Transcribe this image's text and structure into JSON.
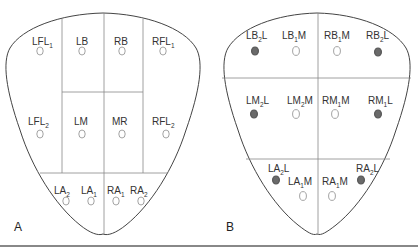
{
  "figure": {
    "panels": [
      {
        "letter": "A",
        "regions": [
          {
            "label": "LFL",
            "sub": "1",
            "suffix": "",
            "marker": "open"
          },
          {
            "label": "LB",
            "sub": "",
            "suffix": "",
            "marker": "open"
          },
          {
            "label": "RB",
            "sub": "",
            "suffix": "",
            "marker": "open"
          },
          {
            "label": "RFL",
            "sub": "1",
            "suffix": "",
            "marker": "open"
          },
          {
            "label": "LFL",
            "sub": "2",
            "suffix": "",
            "marker": "open"
          },
          {
            "label": "LM",
            "sub": "",
            "suffix": "",
            "marker": "open"
          },
          {
            "label": "MR",
            "sub": "",
            "suffix": "",
            "marker": "open"
          },
          {
            "label": "RFL",
            "sub": "2",
            "suffix": "",
            "marker": "open"
          },
          {
            "label": "LA",
            "sub": "2",
            "suffix": "",
            "marker": "open"
          },
          {
            "label": "LA",
            "sub": "1",
            "suffix": "",
            "marker": "open"
          },
          {
            "label": "RA",
            "sub": "1",
            "suffix": "",
            "marker": "open"
          },
          {
            "label": "RA",
            "sub": "2",
            "suffix": "",
            "marker": "open"
          }
        ]
      },
      {
        "letter": "B",
        "regions": [
          {
            "label": "LB",
            "sub": "2",
            "suffix": "L",
            "marker": "filled"
          },
          {
            "label": "LB",
            "sub": "1",
            "suffix": "M",
            "marker": "open"
          },
          {
            "label": "RB",
            "sub": "1",
            "suffix": "M",
            "marker": "open"
          },
          {
            "label": "RB",
            "sub": "2",
            "suffix": "L",
            "marker": "filled"
          },
          {
            "label": "LM",
            "sub": "2",
            "suffix": "L",
            "marker": "filled"
          },
          {
            "label": "LM",
            "sub": "2",
            "suffix": "M",
            "marker": "open"
          },
          {
            "label": "RM",
            "sub": "1",
            "suffix": "M",
            "marker": "open"
          },
          {
            "label": "RM",
            "sub": "1",
            "suffix": "L",
            "marker": "filled"
          },
          {
            "label": "LA",
            "sub": "2",
            "suffix": "L",
            "marker": "filled"
          },
          {
            "label": "LA",
            "sub": "1",
            "suffix": "M",
            "marker": "open"
          },
          {
            "label": "RA",
            "sub": "1",
            "suffix": "M",
            "marker": "open"
          },
          {
            "label": "RA",
            "sub": "2",
            "suffix": "L",
            "marker": "filled"
          }
        ]
      }
    ],
    "colors": {
      "outline": "#444444",
      "grid": "#888888",
      "open_marker": "#999999",
      "filled_marker": "#6a6a6a"
    }
  }
}
